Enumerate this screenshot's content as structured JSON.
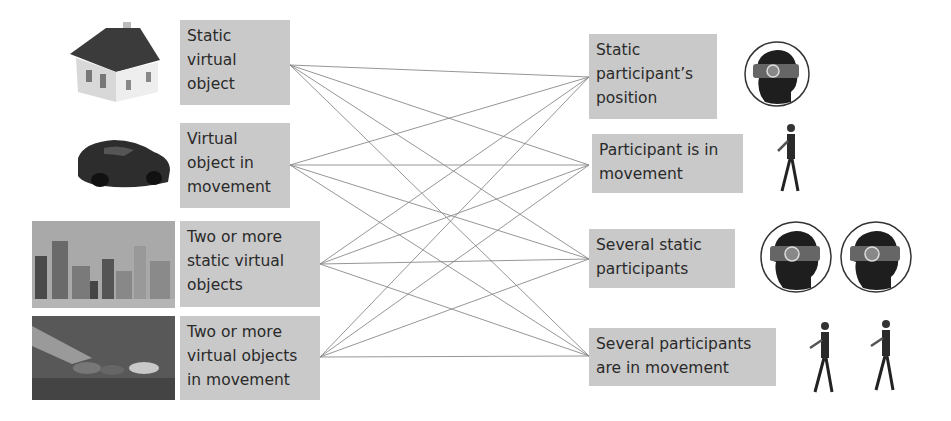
{
  "left_items": [
    {
      "label": "Static virtual object",
      "lines": [
        "Static",
        "virtual",
        "object"
      ],
      "image": "house-icon"
    },
    {
      "label": "Virtual object in movement",
      "lines": [
        "Virtual",
        "object in",
        "movement"
      ],
      "image": "car-icon"
    },
    {
      "label": "Two or more static virtual objects",
      "lines": [
        "Two or more",
        "static virtual",
        "objects"
      ],
      "image": "city-skyline-image"
    },
    {
      "label": "Two or more virtual objects in movement",
      "lines": [
        "Two or more",
        "virtual objects",
        "in movement"
      ],
      "image": "race-cars-image"
    }
  ],
  "right_items": [
    {
      "label": "Static participant's position",
      "lines": [
        "Static",
        "participant’s",
        "position"
      ],
      "image": "vr-headset-head-icon"
    },
    {
      "label": "Participant is in movement",
      "lines": [
        "Participant is in",
        "movement"
      ],
      "image": "walking-person-icon"
    },
    {
      "label": "Several static participants",
      "lines": [
        "Several static",
        "participants"
      ],
      "image": "two-vr-headset-heads-icon"
    },
    {
      "label": "Several participants are in movement",
      "lines": [
        "Several participants",
        "are in movement"
      ],
      "image": "two-walking-persons-icon"
    }
  ],
  "connections": "all-to-all (4x4)",
  "colors": {
    "box_fill": "#c9c9c9",
    "line": "#8a8a8a",
    "text": "#2a2a2a"
  }
}
